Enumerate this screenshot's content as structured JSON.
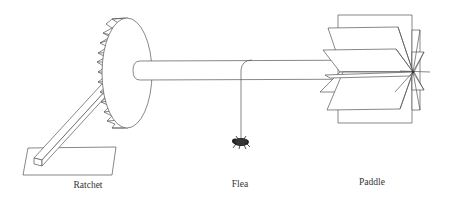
{
  "diagram": {
    "labels": {
      "ratchet": "Ratchet",
      "flea": "Flea",
      "paddle": "Paddle"
    },
    "colors": {
      "line": "#555555",
      "flea_body": "#222222",
      "background": "#ffffff"
    }
  }
}
